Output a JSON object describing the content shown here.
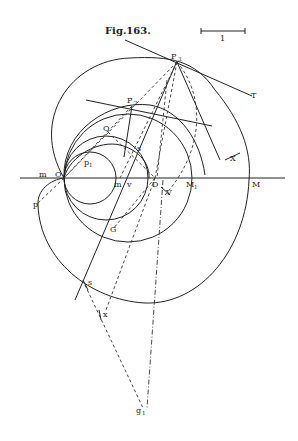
{
  "figure": {
    "title": "Fig.163.",
    "scale_bar_label": "1"
  },
  "labels": {
    "P3": "P",
    "P3_sub": "3",
    "T": "T",
    "P2": "P",
    "P2_sub": "2",
    "Q": "Q",
    "p1": "p",
    "p1_sub": "1",
    "s_upper": "s",
    "X": "X",
    "m_left": "m",
    "O": "O",
    "m_mid": "m",
    "v": "v",
    "D": "D",
    "V": "V",
    "M1": "M",
    "M1_sub": "1",
    "M": "M",
    "p": "p",
    "G": "G",
    "s_lower": "s",
    "x": "x",
    "g1": "g",
    "g1_sub": "1"
  },
  "colors": {
    "ink": "#222222",
    "paper": "#ffffff"
  }
}
